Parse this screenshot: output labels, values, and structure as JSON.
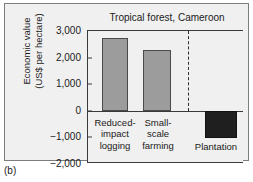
{
  "caption": "(b)",
  "chart_data": {
    "type": "bar",
    "title": "Tropical forest, Cameroon",
    "xlabel": "",
    "ylabel_lines": [
      "Economic value",
      "(US$ per hectare)"
    ],
    "ylabel": "Economic value (US$ per hectare)",
    "ylim": [
      -2000,
      3000
    ],
    "yticks": [
      3000,
      2000,
      1000,
      0,
      -1000,
      -2000
    ],
    "ytick_labels": [
      "3,000",
      "2,000",
      "1,000",
      "0",
      "−1,000",
      "−2,000"
    ],
    "grid": false,
    "legend": "none",
    "categories": [
      "Reduced-impact logging",
      "Small-scale farming",
      "Plantation"
    ],
    "category_label_lines": [
      [
        "Reduced-",
        "impact",
        "logging"
      ],
      [
        "Small-",
        "scale",
        "farming"
      ],
      [
        "Plantation"
      ]
    ],
    "values": [
      2720,
      2280,
      -1040
    ],
    "bar_colors": [
      "#9c9c9c",
      "#9c9c9c",
      "#1f1f1f"
    ],
    "divider_after_category_index": 1,
    "divider_style": "dashed"
  }
}
